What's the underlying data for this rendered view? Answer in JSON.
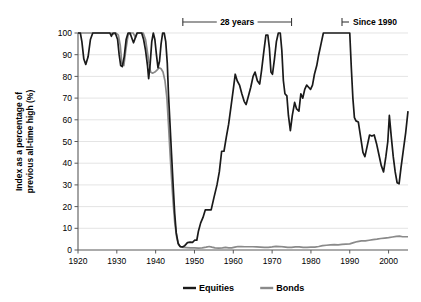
{
  "chart_data": {
    "type": "line",
    "title": "",
    "xlabel": "",
    "ylabel": "Index as a percentage of previous all-time high (%)",
    "xlim": [
      1920,
      2005
    ],
    "ylim": [
      0,
      100
    ],
    "grid": true,
    "legend_position": "bottom-center",
    "xticks": [
      1920,
      1930,
      1940,
      1950,
      1960,
      1970,
      1980,
      1990,
      2000
    ],
    "yticks": [
      0,
      10,
      20,
      30,
      40,
      50,
      60,
      70,
      80,
      90,
      100
    ],
    "colors": {
      "equities": "#1a1a1a",
      "bonds": "#8a8a8a",
      "grid": "#d9d9d9",
      "axis": "#595959"
    },
    "annotations": [
      {
        "name": "28 years",
        "label": "28 years",
        "type": "span-bracket",
        "x_start": 1947.0,
        "x_end": 1975.0,
        "y_px": 22
      },
      {
        "name": "Since 1990",
        "label": "Since 1990",
        "type": "open-bracket",
        "x_start": 1988.0,
        "y_px": 22
      }
    ],
    "series": [
      {
        "name": "Equities",
        "color": "#1a1a1a",
        "points": [
          [
            1920,
            100
          ],
          [
            1920.6,
            100
          ],
          [
            1921.0,
            96
          ],
          [
            1921.5,
            88
          ],
          [
            1922.0,
            85.5
          ],
          [
            1922.6,
            89
          ],
          [
            1923.2,
            97
          ],
          [
            1923.8,
            100
          ],
          [
            1925,
            100
          ],
          [
            1927,
            100
          ],
          [
            1928.2,
            100
          ],
          [
            1928.6,
            98.5
          ],
          [
            1929.0,
            100
          ],
          [
            1929.6,
            100
          ],
          [
            1930.2,
            97
          ],
          [
            1930.6,
            90
          ],
          [
            1931.0,
            85
          ],
          [
            1931.4,
            84.5
          ],
          [
            1931.9,
            89
          ],
          [
            1932.4,
            97
          ],
          [
            1932.9,
            100
          ],
          [
            1933.4,
            100
          ],
          [
            1933.9,
            97.5
          ],
          [
            1934.3,
            95.5
          ],
          [
            1934.8,
            98
          ],
          [
            1935.2,
            100
          ],
          [
            1935.8,
            100
          ],
          [
            1936.4,
            100
          ],
          [
            1936.9,
            97
          ],
          [
            1937.4,
            92
          ],
          [
            1937.9,
            85
          ],
          [
            1938.2,
            79
          ],
          [
            1938.6,
            86
          ],
          [
            1939.0,
            96
          ],
          [
            1939.4,
            100
          ],
          [
            1939.8,
            97
          ],
          [
            1940.2,
            90
          ],
          [
            1940.6,
            84
          ],
          [
            1941.0,
            87
          ],
          [
            1941.4,
            95
          ],
          [
            1941.8,
            100
          ],
          [
            1942.2,
            100
          ],
          [
            1942.6,
            96
          ],
          [
            1943.0,
            86
          ],
          [
            1943.3,
            72
          ],
          [
            1943.7,
            58
          ],
          [
            1944.1,
            44
          ],
          [
            1944.5,
            30
          ],
          [
            1944.9,
            17
          ],
          [
            1945.3,
            8
          ],
          [
            1945.8,
            3
          ],
          [
            1946.3,
            1.6
          ],
          [
            1946.9,
            1.4
          ],
          [
            1947.5,
            2.0
          ],
          [
            1948.2,
            3.4
          ],
          [
            1948.9,
            3.6
          ],
          [
            1949.5,
            3.5
          ],
          [
            1950.1,
            4.6
          ],
          [
            1950.6,
            4.5
          ],
          [
            1951.0,
            8.5
          ],
          [
            1951.6,
            12.5
          ],
          [
            1952.2,
            15
          ],
          [
            1952.8,
            18.5
          ],
          [
            1953.6,
            18.5
          ],
          [
            1954.3,
            18.5
          ],
          [
            1955.0,
            24
          ],
          [
            1955.8,
            30
          ],
          [
            1956.4,
            36
          ],
          [
            1957.0,
            45.5
          ],
          [
            1957.6,
            45.5
          ],
          [
            1958.2,
            52
          ],
          [
            1958.8,
            58
          ],
          [
            1959.4,
            66
          ],
          [
            1960.0,
            74
          ],
          [
            1960.5,
            81
          ],
          [
            1961.0,
            78
          ],
          [
            1961.6,
            76
          ],
          [
            1962.2,
            72
          ],
          [
            1962.8,
            68.5
          ],
          [
            1963.3,
            67
          ],
          [
            1963.9,
            71
          ],
          [
            1964.5,
            75
          ],
          [
            1965.1,
            80
          ],
          [
            1965.6,
            82
          ],
          [
            1966.2,
            78
          ],
          [
            1966.8,
            76.5
          ],
          [
            1967.3,
            83
          ],
          [
            1967.9,
            92
          ],
          [
            1968.4,
            99
          ],
          [
            1968.9,
            99
          ],
          [
            1969.3,
            93
          ],
          [
            1969.7,
            82
          ],
          [
            1970.1,
            81
          ],
          [
            1970.6,
            88
          ],
          [
            1971.1,
            96
          ],
          [
            1971.6,
            100
          ],
          [
            1972.1,
            100
          ],
          [
            1972.5,
            92
          ],
          [
            1972.9,
            78
          ],
          [
            1973.3,
            72
          ],
          [
            1973.8,
            71
          ],
          [
            1974.2,
            62
          ],
          [
            1974.7,
            55
          ],
          [
            1975.2,
            62
          ],
          [
            1975.8,
            68
          ],
          [
            1976.3,
            65
          ],
          [
            1976.9,
            64
          ],
          [
            1977.4,
            72
          ],
          [
            1977.9,
            70
          ],
          [
            1978.4,
            74
          ],
          [
            1978.9,
            76
          ],
          [
            1979.4,
            75
          ],
          [
            1979.9,
            74
          ],
          [
            1980.4,
            76
          ],
          [
            1980.9,
            81
          ],
          [
            1981.5,
            85
          ],
          [
            1982.0,
            90
          ],
          [
            1982.6,
            95
          ],
          [
            1983.2,
            100
          ],
          [
            1984.0,
            100
          ],
          [
            1986,
            100
          ],
          [
            1988,
            100
          ],
          [
            1989.5,
            100
          ],
          [
            1990.0,
            100
          ],
          [
            1990.4,
            84
          ],
          [
            1990.8,
            70
          ],
          [
            1991.2,
            61
          ],
          [
            1991.6,
            59.5
          ],
          [
            1992.2,
            59
          ],
          [
            1992.8,
            52
          ],
          [
            1993.4,
            45
          ],
          [
            1993.9,
            43
          ],
          [
            1994.5,
            48
          ],
          [
            1995.1,
            53
          ],
          [
            1995.7,
            52.5
          ],
          [
            1996.3,
            53
          ],
          [
            1996.9,
            49
          ],
          [
            1997.5,
            44
          ],
          [
            1998.1,
            39
          ],
          [
            1998.7,
            36
          ],
          [
            1999.3,
            43
          ],
          [
            1999.8,
            50
          ],
          [
            2000.2,
            62
          ],
          [
            2000.7,
            52
          ],
          [
            2001.2,
            43
          ],
          [
            2001.7,
            36
          ],
          [
            2002.2,
            31
          ],
          [
            2002.7,
            30.5
          ],
          [
            2003.2,
            38
          ],
          [
            2003.8,
            46
          ],
          [
            2004.4,
            54
          ],
          [
            2005.0,
            64
          ]
        ]
      },
      {
        "name": "Bonds",
        "color": "#8a8a8a",
        "points": [
          [
            1920,
            100
          ],
          [
            1921.5,
            100
          ],
          [
            1923,
            100
          ],
          [
            1925,
            100
          ],
          [
            1927,
            100
          ],
          [
            1928.5,
            100
          ],
          [
            1929.2,
            99.5
          ],
          [
            1929.8,
            100
          ],
          [
            1930.4,
            99
          ],
          [
            1930.9,
            94
          ],
          [
            1931.3,
            86
          ],
          [
            1931.8,
            85
          ],
          [
            1932.3,
            92
          ],
          [
            1932.9,
            99
          ],
          [
            1933.5,
            100
          ],
          [
            1934.2,
            100
          ],
          [
            1934.8,
            98
          ],
          [
            1935.3,
            100
          ],
          [
            1936.0,
            100
          ],
          [
            1936.8,
            100
          ],
          [
            1937.4,
            97
          ],
          [
            1937.9,
            91
          ],
          [
            1938.3,
            86
          ],
          [
            1938.7,
            82
          ],
          [
            1939.2,
            81.5
          ],
          [
            1939.8,
            82
          ],
          [
            1940.4,
            83
          ],
          [
            1940.9,
            84
          ],
          [
            1941.4,
            83.5
          ],
          [
            1941.9,
            82
          ],
          [
            1942.4,
            78
          ],
          [
            1942.9,
            70
          ],
          [
            1943.3,
            58
          ],
          [
            1943.7,
            45
          ],
          [
            1944.1,
            33
          ],
          [
            1944.5,
            22
          ],
          [
            1944.9,
            13
          ],
          [
            1945.4,
            6
          ],
          [
            1945.9,
            2.5
          ],
          [
            1946.5,
            1.3
          ],
          [
            1947.2,
            1.2
          ],
          [
            1948.0,
            1.1
          ],
          [
            1949.0,
            1.0
          ],
          [
            1950.0,
            1.0
          ],
          [
            1951.0,
            0.9
          ],
          [
            1952.0,
            1.0
          ],
          [
            1953.0,
            1.3
          ],
          [
            1953.8,
            1.6
          ],
          [
            1954.5,
            1.3
          ],
          [
            1955.3,
            1.0
          ],
          [
            1956.2,
            0.9
          ],
          [
            1957.2,
            1.0
          ],
          [
            1958.0,
            1.2
          ],
          [
            1958.8,
            1.0
          ],
          [
            1959.6,
            1.0
          ],
          [
            1960.4,
            1.3
          ],
          [
            1961.2,
            1.6
          ],
          [
            1962.0,
            1.6
          ],
          [
            1963.0,
            1.5
          ],
          [
            1964.0,
            1.5
          ],
          [
            1965.0,
            1.5
          ],
          [
            1966.0,
            1.4
          ],
          [
            1967.0,
            1.3
          ],
          [
            1968.0,
            1.2
          ],
          [
            1969.0,
            1.2
          ],
          [
            1970.0,
            1.4
          ],
          [
            1971.0,
            1.7
          ],
          [
            1972.0,
            1.6
          ],
          [
            1973.0,
            1.4
          ],
          [
            1974.0,
            1.2
          ],
          [
            1975.0,
            1.2
          ],
          [
            1976.0,
            1.4
          ],
          [
            1977.0,
            1.4
          ],
          [
            1978.0,
            1.2
          ],
          [
            1979.0,
            1.2
          ],
          [
            1980.0,
            1.3
          ],
          [
            1981.0,
            1.3
          ],
          [
            1982.0,
            1.6
          ],
          [
            1983.0,
            2.0
          ],
          [
            1984.0,
            2.2
          ],
          [
            1985.0,
            2.4
          ],
          [
            1986.0,
            2.5
          ],
          [
            1987.0,
            2.4
          ],
          [
            1988.0,
            2.6
          ],
          [
            1989.0,
            2.7
          ],
          [
            1990.0,
            2.8
          ],
          [
            1991.0,
            3.4
          ],
          [
            1992.0,
            3.9
          ],
          [
            1993.0,
            4.2
          ],
          [
            1994.0,
            4.2
          ],
          [
            1995.0,
            4.5
          ],
          [
            1996.0,
            4.8
          ],
          [
            1997.0,
            5.0
          ],
          [
            1998.0,
            5.3
          ],
          [
            1999.0,
            5.5
          ],
          [
            2000.0,
            5.7
          ],
          [
            2001.0,
            6.0
          ],
          [
            2002.0,
            6.3
          ],
          [
            2002.8,
            6.4
          ],
          [
            2003.6,
            6.1
          ],
          [
            2005.0,
            6.1
          ]
        ]
      }
    ],
    "legend": [
      {
        "label": "Equities",
        "color": "#1a1a1a"
      },
      {
        "label": "Bonds",
        "color": "#8a8a8a"
      }
    ]
  }
}
